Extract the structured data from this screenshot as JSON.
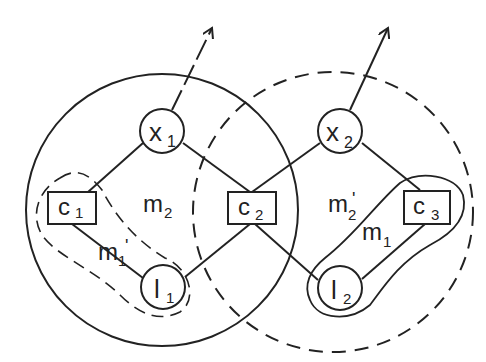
{
  "diagram": {
    "nodes": {
      "x1": {
        "main": "x",
        "sub": "1"
      },
      "x2": {
        "main": "x",
        "sub": "2"
      },
      "c1": {
        "main": "c",
        "sub": "1"
      },
      "c2": {
        "main": "c",
        "sub": "2"
      },
      "c3": {
        "main": "c",
        "sub": "3"
      },
      "l1": {
        "main": "l",
        "sub": "1"
      },
      "l2": {
        "main": "l",
        "sub": "2"
      }
    },
    "regions": {
      "m2": {
        "main": "m",
        "sub": "2",
        "prime": ""
      },
      "m2p": {
        "main": "m",
        "sub": "2",
        "prime": "'"
      },
      "m1": {
        "main": "m",
        "sub": "1",
        "prime": ""
      },
      "m1p": {
        "main": "m",
        "sub": "1",
        "prime": "'"
      }
    },
    "colors": {
      "ink": "#222222",
      "background": "#ffffff"
    }
  }
}
